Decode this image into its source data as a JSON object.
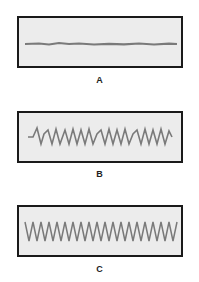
{
  "panels": [
    {
      "label": "A",
      "waveform": "flat-noisy-line",
      "peaks": 0
    },
    {
      "label": "B",
      "waveform": "irregular-sawtooth",
      "peaks": 13
    },
    {
      "label": "C",
      "waveform": "regular-zigzag",
      "peaks": 20
    }
  ],
  "colors": {
    "border": "#1a1a1a",
    "panel_bg": "#ececec",
    "trace": "#7a7a7a"
  }
}
